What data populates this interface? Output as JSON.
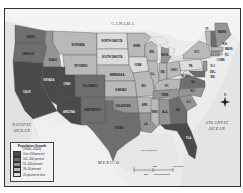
{
  "map": {
    "title": "Population Growth",
    "period": "1940–2000",
    "labels": {
      "canada": "CANADA",
      "mexico": "MEXICO",
      "pacific": "PACIFIC OCEAN",
      "pacific_line1": "PACIFIC",
      "pacific_line2": "OCEAN",
      "atlantic_line1": "ATLANTIC",
      "atlantic_line2": "OCEAN",
      "gulf": "Gulf of Mexico"
    },
    "scale": {
      "mi_0": "0",
      "mi_mid": "250",
      "mi_end": "500 miles",
      "km_mid": "250",
      "km_end": "500 kilometers"
    },
    "compass": "N"
  },
  "legend": {
    "title": "Population Growth",
    "subtitle": "(1940–2000)",
    "items": [
      {
        "label": "Over 200 percent",
        "color": "#4a4a4a"
      },
      {
        "label": "101–200 percent",
        "color": "#6e6e6e"
      },
      {
        "label": "51–100 percent",
        "color": "#959595"
      },
      {
        "label": "26–50 percent",
        "color": "#b9b9b9"
      },
      {
        "label": "25 percent or less",
        "color": "#dcdcdc"
      }
    ]
  },
  "states": [
    {
      "abbr": "WASH.",
      "name": "Washington",
      "category": 1
    },
    {
      "abbr": "OREGON",
      "name": "Oregon",
      "category": 1
    },
    {
      "abbr": "IDAHO",
      "name": "Idaho",
      "category": 2
    },
    {
      "abbr": "MONTANA",
      "name": "Montana",
      "category": 3
    },
    {
      "abbr": "WYOMING",
      "name": "Wyoming",
      "category": 3
    },
    {
      "abbr": "NORTH DAKOTA",
      "name": "North Dakota",
      "category": 4
    },
    {
      "abbr": "SOUTH DAKOTA",
      "name": "South Dakota",
      "category": 4
    },
    {
      "abbr": "NEBRASKA",
      "name": "Nebraska",
      "category": 3
    },
    {
      "abbr": "KANSAS",
      "name": "Kansas",
      "category": 3
    },
    {
      "abbr": "OKLAHOMA",
      "name": "Oklahoma",
      "category": 2
    },
    {
      "abbr": "TEXAS",
      "name": "Texas",
      "category": 1
    },
    {
      "abbr": "NEVADA",
      "name": "Nevada",
      "category": 0
    },
    {
      "abbr": "UTAH",
      "name": "Utah",
      "category": 0
    },
    {
      "abbr": "COLORADO",
      "name": "Colorado",
      "category": 1
    },
    {
      "abbr": "ARIZONA",
      "name": "Arizona",
      "category": 0
    },
    {
      "abbr": "NEW MEXICO",
      "name": "New Mexico",
      "category": 1
    },
    {
      "abbr": "CALIF.",
      "name": "California",
      "category": 0
    },
    {
      "abbr": "MINN.",
      "name": "Minnesota",
      "category": 3
    },
    {
      "abbr": "IOWA",
      "name": "Iowa",
      "category": 4
    },
    {
      "abbr": "MO.",
      "name": "Missouri",
      "category": 3
    },
    {
      "abbr": "ARK.",
      "name": "Arkansas",
      "category": 3
    },
    {
      "abbr": "LA.",
      "name": "Louisiana",
      "category": 2
    },
    {
      "abbr": "WIS.",
      "name": "Wisconsin",
      "category": 3
    },
    {
      "abbr": "ILL.",
      "name": "Illinois",
      "category": 3
    },
    {
      "abbr": "MICH.",
      "name": "Michigan",
      "category": 2
    },
    {
      "abbr": "IND.",
      "name": "Indiana",
      "category": 3
    },
    {
      "abbr": "OHIO",
      "name": "Ohio",
      "category": 3
    },
    {
      "abbr": "KY.",
      "name": "Kentucky",
      "category": 3
    },
    {
      "abbr": "TENN.",
      "name": "Tennessee",
      "category": 2
    },
    {
      "abbr": "MISS.",
      "name": "Mississippi",
      "category": 3
    },
    {
      "abbr": "ALA.",
      "name": "Alabama",
      "category": 2
    },
    {
      "abbr": "GA.",
      "name": "Georgia",
      "category": 1
    },
    {
      "abbr": "FLA.",
      "name": "Florida",
      "category": 0
    },
    {
      "abbr": "S.C.",
      "name": "South Carolina",
      "category": 2
    },
    {
      "abbr": "N.C.",
      "name": "North Carolina",
      "category": 2
    },
    {
      "abbr": "VA.",
      "name": "Virginia",
      "category": 1
    },
    {
      "abbr": "W.VA.",
      "name": "West Virginia",
      "category": 4
    },
    {
      "abbr": "PA.",
      "name": "Pennsylvania",
      "category": 4
    },
    {
      "abbr": "N.Y.",
      "name": "New York",
      "category": 3
    },
    {
      "abbr": "VT.",
      "name": "Vermont",
      "category": 3
    },
    {
      "abbr": "N.H.",
      "name": "New Hampshire",
      "category": 1
    },
    {
      "abbr": "MAINE",
      "name": "Maine",
      "category": 3
    },
    {
      "abbr": "MASS.",
      "name": "Massachusetts",
      "category": 3
    },
    {
      "abbr": "R.I.",
      "name": "Rhode Island",
      "category": 3
    },
    {
      "abbr": "CONN.",
      "name": "Connecticut",
      "category": 2
    },
    {
      "abbr": "N.J.",
      "name": "New Jersey",
      "category": 2
    },
    {
      "abbr": "DEL.",
      "name": "Delaware",
      "category": 1
    },
    {
      "abbr": "MD.",
      "name": "Maryland",
      "category": 1
    }
  ]
}
